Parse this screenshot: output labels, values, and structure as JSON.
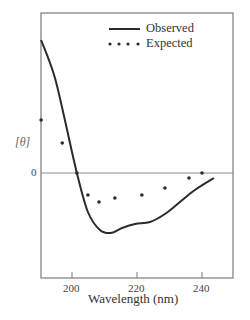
{
  "chart_data": {
    "type": "line",
    "title": "",
    "xlabel": "Wavelength (nm)",
    "ylabel": "[θ]",
    "xlim": [
      190.5,
      249.5
    ],
    "ylim": [
      -10.5,
      16
    ],
    "xticks": [
      200,
      220,
      240
    ],
    "xtick_labels": [
      "200",
      "220",
      "240"
    ],
    "yticks": [
      0
    ],
    "ytick_labels": [
      "0"
    ],
    "zero_line": true,
    "grid": false,
    "legend_position": "upper right",
    "series": [
      {
        "name": "Observed",
        "style": "solid-line",
        "x": [
          190.5,
          194.5,
          197.8,
          201.5,
          204.9,
          208.6,
          212.0,
          215.4,
          219.4,
          224.0,
          228.6,
          233.2,
          237.8,
          243.7
        ],
        "y": [
          13.3,
          9.8,
          5.3,
          0.0,
          -3.9,
          -5.7,
          -6.0,
          -5.5,
          -5.1,
          -4.9,
          -4.1,
          -2.9,
          -1.7,
          -0.5
        ]
      },
      {
        "name": "Expected",
        "style": "dots",
        "x": [
          190.5,
          197.0,
          201.5,
          204.9,
          208.3,
          213.2,
          221.5,
          228.6,
          236.0,
          240.0
        ],
        "y": [
          5.3,
          3.0,
          0.0,
          -2.2,
          -2.9,
          -2.5,
          -2.2,
          -1.5,
          -0.5,
          0.0
        ]
      }
    ]
  },
  "legend": {
    "observed_label": "Observed",
    "expected_label": "Expected"
  },
  "axes": {
    "xlabel": "Wavelength (nm)",
    "ylabel": "[θ]",
    "zero_label": "0"
  },
  "colors": {
    "line": "#2b2b2b",
    "frame": "#7a7a7a",
    "dots": "#2b2b2b"
  }
}
